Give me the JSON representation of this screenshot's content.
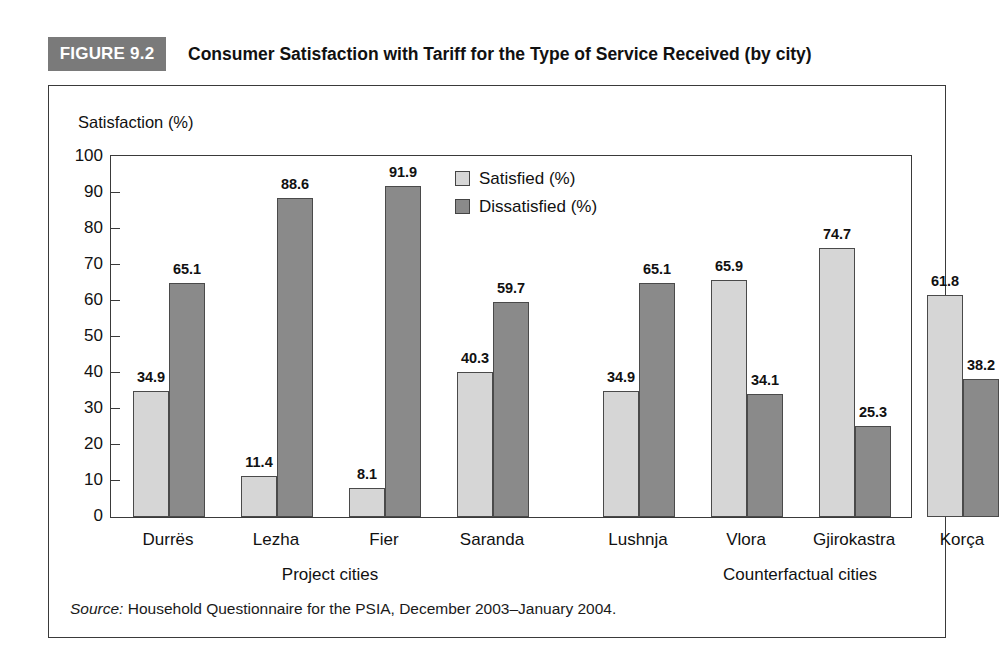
{
  "figure": {
    "badge": "FIGURE 9.2",
    "title": "Consumer Satisfaction with Tariff for the Type of Service Received (by city)"
  },
  "source": {
    "label": "Source:",
    "text": " Household Questionnaire for the PSIA, December 2003–January 2004."
  },
  "colors": {
    "satisfied": "#d6d6d6",
    "dissatisfied": "#8a8a8a",
    "badge_background": "#7a7a7a",
    "frame": "#3a3a3a"
  },
  "legend": {
    "position": "inside-top-center",
    "items": [
      {
        "name": "satisfied",
        "label": "Satisfied (%)"
      },
      {
        "name": "dissatisfied",
        "label": "Dissatisfied (%)"
      }
    ]
  },
  "axis": {
    "y_caption": "Satisfaction (%)",
    "y_ticks": [
      "100",
      "90",
      "80",
      "70",
      "60",
      "50",
      "40",
      "30",
      "20",
      "10",
      "0"
    ],
    "group_labels": [
      "Project cities",
      "Counterfactual cities"
    ]
  },
  "chart_data": {
    "type": "bar",
    "title": "Consumer Satisfaction with Tariff for the Type of Service Received (by city)",
    "xlabel": "",
    "ylabel": "Satisfaction (%)",
    "ylim": [
      0,
      100
    ],
    "ytick_step": 10,
    "grid": false,
    "legend_position": "inside-top-center",
    "categories": [
      "Durrës",
      "Lezha",
      "Fier",
      "Saranda",
      "Lushnja",
      "Vlora",
      "Gjirokastra",
      "Korça"
    ],
    "category_groups": [
      {
        "label": "Project cities",
        "categories": [
          "Durrës",
          "Lezha",
          "Fier",
          "Saranda"
        ]
      },
      {
        "label": "Counterfactual cities",
        "categories": [
          "Lushnja",
          "Vlora",
          "Gjirokastra",
          "Korça"
        ]
      }
    ],
    "series": [
      {
        "name": "Satisfied (%)",
        "color": "#d6d6d6",
        "values": [
          34.9,
          11.4,
          8.1,
          40.3,
          34.9,
          65.9,
          74.7,
          61.8
        ],
        "labels": [
          "34.9",
          "11.4",
          "8.1",
          "40.3",
          "34.9",
          "65.9",
          "74.7",
          "61.8"
        ]
      },
      {
        "name": "Dissatisfied (%)",
        "color": "#8a8a8a",
        "values": [
          65.1,
          88.6,
          91.9,
          59.7,
          65.1,
          34.1,
          25.3,
          38.2
        ],
        "labels": [
          "65.1",
          "88.6",
          "91.9",
          "59.7",
          "65.1",
          "34.1",
          "25.3",
          "38.2"
        ]
      }
    ]
  }
}
